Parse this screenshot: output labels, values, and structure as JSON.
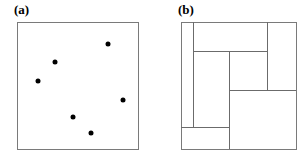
{
  "figure": {
    "width": 308,
    "height": 163,
    "background": "#ffffff",
    "stroke_color": "#6b6b6b",
    "frame_color": "#7a7a7a",
    "point_color": "#000000"
  },
  "panels": [
    {
      "id": "a",
      "label": "(a)",
      "type": "scatter",
      "frame": {
        "x": 17,
        "y": 22,
        "width": 121,
        "height": 127
      }
    },
    {
      "id": "b",
      "label": "(b)",
      "type": "partition",
      "frame": {
        "x": 181,
        "y": 22,
        "width": 115,
        "height": 127
      }
    }
  ],
  "chart_data": [
    {
      "type": "scatter",
      "title": "(a)",
      "xlabel": "",
      "ylabel": "",
      "xlim": [
        0,
        121
      ],
      "ylim": [
        0,
        127
      ],
      "grid": false,
      "legend": null,
      "marker": {
        "shape": "circle",
        "color": "#000000",
        "size_px": 5
      },
      "points": [
        {
          "x": 91,
          "y": 22
        },
        {
          "x": 38,
          "y": 40
        },
        {
          "x": 21,
          "y": 59
        },
        {
          "x": 106,
          "y": 78
        },
        {
          "x": 56,
          "y": 95
        },
        {
          "x": 74,
          "y": 111
        }
      ]
    },
    {
      "type": "partition",
      "title": "(b)",
      "xlabel": "",
      "ylabel": "",
      "xlim": [
        0,
        115
      ],
      "ylim": [
        0,
        127
      ],
      "grid": false,
      "legend": null,
      "segments": [
        {
          "name": "vertical-left-divider",
          "orientation": "vertical",
          "x": 12,
          "y1": 0,
          "y2": 105
        },
        {
          "name": "vertical-right-divider",
          "orientation": "vertical",
          "x": 86,
          "y1": 0,
          "y2": 68
        },
        {
          "name": "horizontal-upper",
          "orientation": "horizontal",
          "y": 29,
          "x1": 12,
          "x2": 86
        },
        {
          "name": "vertical-middle-upper",
          "orientation": "vertical",
          "x": 48,
          "y1": 29,
          "y2": 68
        },
        {
          "name": "horizontal-middle",
          "orientation": "horizontal",
          "y": 68,
          "x1": 48,
          "x2": 115
        },
        {
          "name": "horizontal-lower",
          "orientation": "horizontal",
          "y": 105,
          "x1": 0,
          "x2": 48
        },
        {
          "name": "vertical-middle-lower",
          "orientation": "vertical",
          "x": 48,
          "y1": 68,
          "y2": 127
        }
      ],
      "rectangles": [
        {
          "name": "left-tall",
          "x": 0,
          "y": 0,
          "width": 12,
          "height": 105
        },
        {
          "name": "top-center",
          "x": 12,
          "y": 0,
          "width": 74,
          "height": 29
        },
        {
          "name": "right-tall",
          "x": 86,
          "y": 0,
          "width": 29,
          "height": 68
        },
        {
          "name": "middle-left-tall",
          "x": 12,
          "y": 29,
          "width": 36,
          "height": 76
        },
        {
          "name": "middle-center",
          "x": 48,
          "y": 29,
          "width": 38,
          "height": 39
        },
        {
          "name": "bottom-right",
          "x": 48,
          "y": 68,
          "width": 67,
          "height": 59
        },
        {
          "name": "bottom-left",
          "x": 0,
          "y": 105,
          "width": 48,
          "height": 22
        }
      ]
    }
  ]
}
